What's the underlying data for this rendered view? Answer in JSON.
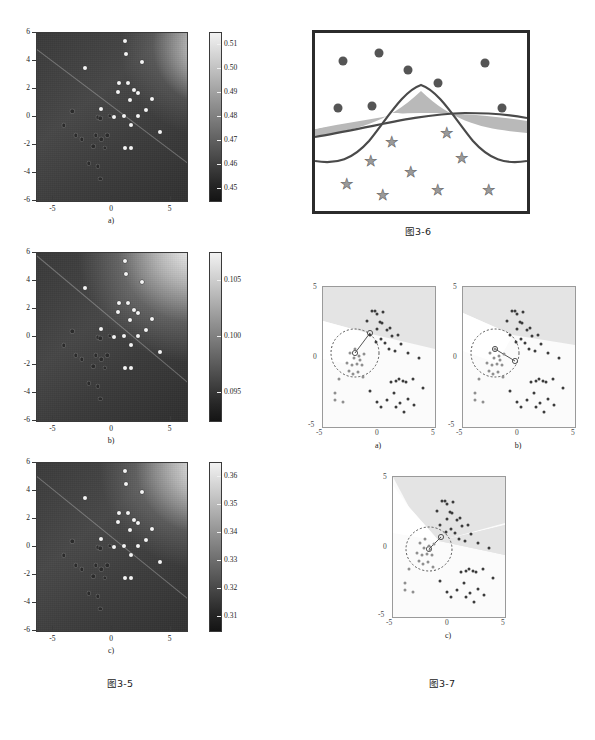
{
  "figure_3_5": {
    "caption": "图3-5",
    "panels": [
      {
        "label": "a)",
        "colorbar_ticks": [
          "0.51",
          "0.50",
          "0.49",
          "0.48",
          "0.47",
          "0.46",
          "0.45"
        ],
        "x_ticks": [
          "-5",
          "0",
          "5"
        ],
        "y_ticks": [
          "6",
          "4",
          "2",
          "0",
          "-2",
          "-4",
          "-6"
        ],
        "cmap": "grayscale",
        "value_min": 0.445,
        "value_max": 0.515
      },
      {
        "label": "b)",
        "colorbar_ticks": [
          "0.105",
          "0.100",
          "0.095"
        ],
        "x_ticks": [
          "-5",
          "0",
          "5"
        ],
        "y_ticks": [
          "6",
          "4",
          "2",
          "0",
          "-2",
          "-4",
          "-6"
        ],
        "cmap": "grayscale",
        "value_min": 0.092,
        "value_max": 0.108
      },
      {
        "label": "c)",
        "colorbar_ticks": [
          "0.36",
          "0.35",
          "0.34",
          "0.33",
          "0.32",
          "0.31"
        ],
        "x_ticks": [
          "-5",
          "0",
          "5"
        ],
        "y_ticks": [
          "6",
          "4",
          "2",
          "0",
          "-2",
          "-4",
          "-6"
        ],
        "cmap": "grayscale",
        "value_min": 0.305,
        "value_max": 0.365
      }
    ],
    "white_points": [
      [
        1.1,
        5.4
      ],
      [
        1.2,
        4.5
      ],
      [
        2.6,
        3.9
      ],
      [
        -2.3,
        3.5
      ],
      [
        0.6,
        2.4
      ],
      [
        1.4,
        2.4
      ],
      [
        0.5,
        1.8
      ],
      [
        2.2,
        1.7
      ],
      [
        1.5,
        1.2
      ],
      [
        3.4,
        1.3
      ],
      [
        -0.9,
        0.6
      ],
      [
        1.0,
        0.1
      ],
      [
        2.2,
        0.1
      ],
      [
        2.9,
        0.5
      ],
      [
        1.6,
        -0.6
      ],
      [
        4.1,
        -1.1
      ],
      [
        1.1,
        -2.2
      ],
      [
        1.6,
        -2.2
      ],
      [
        0.2,
        0.0
      ],
      [
        1.9,
        1.9
      ]
    ],
    "dark_points": [
      [
        -3.1,
        -1.3
      ],
      [
        -2.6,
        -1.6
      ],
      [
        -1.4,
        -1.3
      ],
      [
        -0.9,
        -1.6
      ],
      [
        -0.4,
        -1.3
      ],
      [
        -1.2,
        0.0
      ],
      [
        -0.2,
        0.1
      ],
      [
        -1.0,
        -0.1
      ],
      [
        -1.6,
        -2.1
      ],
      [
        -0.6,
        -2.2
      ],
      [
        -2.0,
        -3.3
      ],
      [
        -1.2,
        -3.5
      ],
      [
        -1.0,
        -4.4
      ],
      [
        -3.4,
        0.4
      ],
      [
        -4.1,
        -0.6
      ]
    ]
  },
  "figure_3_6": {
    "caption": "图3-6",
    "circles": [
      [
        0.13,
        0.16
      ],
      [
        0.3,
        0.11
      ],
      [
        0.44,
        0.21
      ],
      [
        0.58,
        0.27
      ],
      [
        0.8,
        0.17
      ],
      [
        0.11,
        0.41
      ],
      [
        0.27,
        0.4
      ],
      [
        0.88,
        0.41
      ]
    ],
    "stars": [
      [
        0.62,
        0.55
      ],
      [
        0.36,
        0.6
      ],
      [
        0.26,
        0.71
      ],
      [
        0.45,
        0.77
      ],
      [
        0.69,
        0.69
      ],
      [
        0.15,
        0.84
      ],
      [
        0.32,
        0.9
      ],
      [
        0.58,
        0.87
      ],
      [
        0.82,
        0.87
      ]
    ],
    "shade_color": "#b9b9b9",
    "curve_color": "#4a4a4a",
    "border_color": "#2b2b2b"
  },
  "figure_3_7": {
    "caption": "图3-7",
    "panels": [
      {
        "label": "a)",
        "x_ticks": [
          "-5",
          "0",
          "5"
        ],
        "y_ticks": [
          "5",
          "0",
          "-5"
        ]
      },
      {
        "label": "b)",
        "x_ticks": [
          "-5",
          "0",
          "5"
        ],
        "y_ticks": [
          "5",
          "0",
          "-5"
        ]
      },
      {
        "label": "c)",
        "x_ticks": [
          "-5",
          "0",
          "5"
        ],
        "y_ticks": [
          "5",
          "0",
          "-5"
        ]
      }
    ],
    "cluster_upper": [
      [
        -0.6,
        3.3
      ],
      [
        -0.4,
        3.3
      ],
      [
        -0.2,
        3.1
      ],
      [
        0.4,
        3.2
      ],
      [
        -1.1,
        2.6
      ],
      [
        0.1,
        2.5
      ],
      [
        0.3,
        2.4
      ],
      [
        -0.2,
        2.0
      ],
      [
        0.7,
        1.9
      ],
      [
        1.0,
        2.1
      ],
      [
        -0.8,
        1.6
      ],
      [
        1.2,
        1.5
      ],
      [
        0.5,
        1.0
      ],
      [
        2.0,
        0.9
      ],
      [
        1.4,
        0.4
      ],
      [
        0.2,
        1.3
      ],
      [
        0.9,
        0.6
      ],
      [
        -0.3,
        1.1
      ],
      [
        1.7,
        1.6
      ],
      [
        2.6,
        0.3
      ]
    ],
    "cluster_left": [
      [
        -2.6,
        0.3
      ],
      [
        -2.2,
        -0.1
      ],
      [
        -2.9,
        -0.4
      ],
      [
        -2.4,
        -0.6
      ],
      [
        -2.0,
        -0.5
      ],
      [
        -1.7,
        -0.2
      ],
      [
        -1.5,
        -0.6
      ],
      [
        -2.7,
        -1.0
      ],
      [
        -2.3,
        -1.2
      ],
      [
        -1.9,
        -1.1
      ],
      [
        -1.4,
        -1.4
      ],
      [
        -3.6,
        -1.6
      ],
      [
        -3.9,
        -2.6
      ],
      [
        -3.9,
        -3.1
      ],
      [
        -3.2,
        -3.2
      ],
      [
        -1.8,
        0.1
      ],
      [
        -2.1,
        0.6
      ],
      [
        -1.3,
        0.2
      ]
    ],
    "cluster_lower": [
      [
        1.1,
        -1.8
      ],
      [
        1.5,
        -1.7
      ],
      [
        1.8,
        -1.6
      ],
      [
        2.1,
        -1.7
      ],
      [
        2.4,
        -1.8
      ],
      [
        3.0,
        -1.6
      ],
      [
        3.6,
        -0.1
      ],
      [
        3.9,
        -2.2
      ],
      [
        1.3,
        -2.6
      ],
      [
        0.7,
        -3.1
      ],
      [
        1.9,
        -3.3
      ],
      [
        2.6,
        -3.0
      ],
      [
        3.1,
        -3.4
      ],
      [
        2.2,
        -3.9
      ],
      [
        1.5,
        -3.6
      ],
      [
        -0.8,
        -2.4
      ],
      [
        -0.2,
        -3.2
      ],
      [
        0.2,
        -3.6
      ]
    ],
    "ellipse_center": [
      -1.9,
      -0.3
    ],
    "ellipse_radius": [
      1.55,
      1.45
    ],
    "shade_color": "#e4e4e4",
    "background_color": "#fbfbfb"
  }
}
